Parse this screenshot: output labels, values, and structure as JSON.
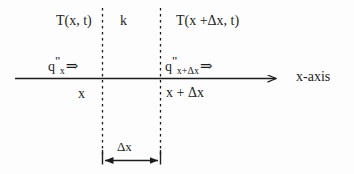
{
  "diagram": {
    "background_color": "#fdfdfd",
    "line_color": "#1d1d1d",
    "labels": {
      "temperature_left": "T(x, t)",
      "conductivity": "k",
      "temperature_right": "T(x +Δx, t)",
      "flux_left_symbol": "q",
      "flux_left_prime": "\"",
      "flux_left_subscript": "x",
      "flux_left_arrow": "⇒",
      "flux_right_symbol": "q",
      "flux_right_prime": "\"",
      "flux_right_subscript": "x+Δx",
      "flux_right_arrow": "⇒",
      "position_left": "x",
      "position_right": "x + Δx",
      "axis_name": "x-axis",
      "thickness": "Δx"
    },
    "geometry": {
      "axis_y": 78,
      "axis_x_start": 15,
      "axis_x_end": 278,
      "dashed_left_x": 102,
      "dashed_right_x": 160,
      "dashed_y_top": 8,
      "dashed_y_bottom": 160,
      "dimension_y": 160
    }
  }
}
